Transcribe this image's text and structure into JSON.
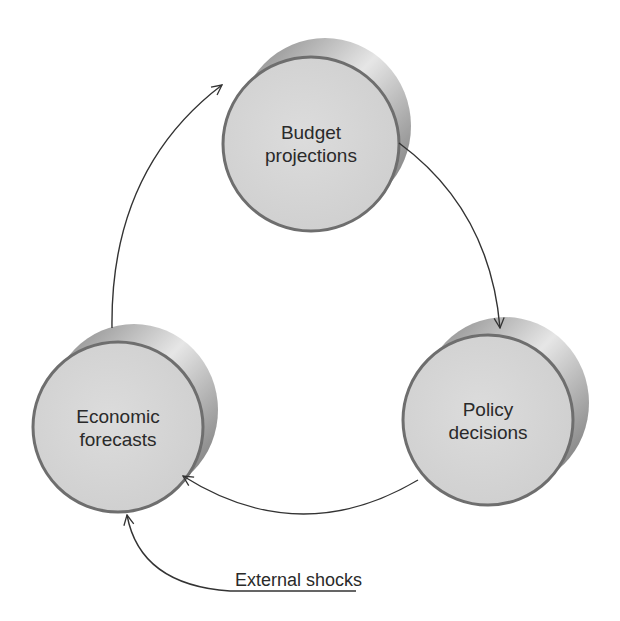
{
  "diagram": {
    "type": "cycle",
    "nodes": [
      {
        "id": "budget",
        "label_line1": "Budget",
        "label_line2": "projections"
      },
      {
        "id": "policy",
        "label_line1": "Policy",
        "label_line2": "decisions"
      },
      {
        "id": "economic",
        "label_line1": "Economic",
        "label_line2": "forecasts"
      }
    ],
    "edges": [
      {
        "from": "budget",
        "to": "policy"
      },
      {
        "from": "policy",
        "to": "economic"
      },
      {
        "from": "economic",
        "to": "budget"
      },
      {
        "from": "external_shocks",
        "to": "economic"
      }
    ],
    "external_input": {
      "label": "External shocks"
    },
    "colors": {
      "face": "#d9d9d9",
      "rim": "#8a8a8a",
      "outline": "#6e6e6e",
      "arrow": "#333333",
      "text": "#2a2a2a"
    }
  }
}
